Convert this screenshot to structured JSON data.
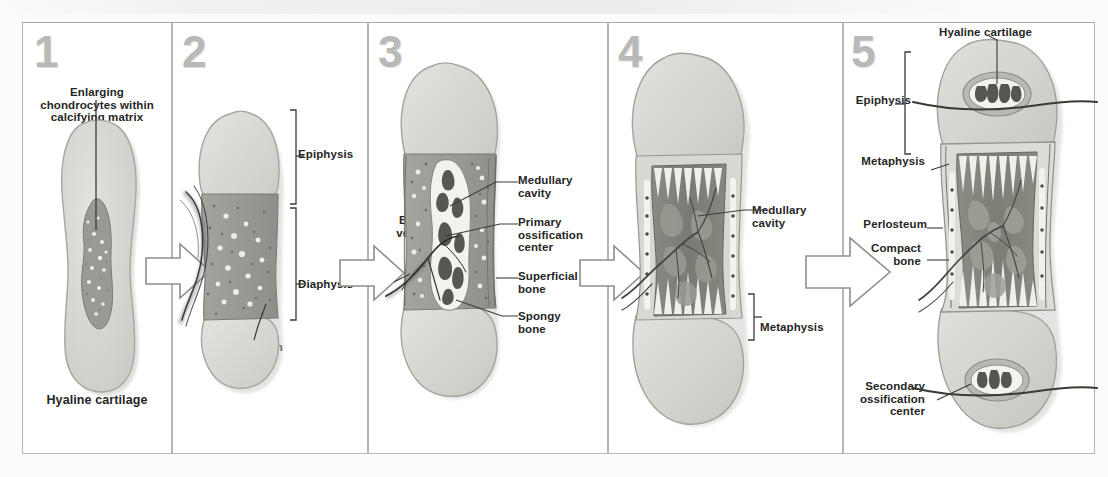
{
  "figure": {
    "panel_count": 5,
    "accent_gray": "#b9b9b7",
    "text_color": "#262626"
  },
  "panels": [
    {
      "number": "1",
      "labels": {
        "top": "Enlarging\nchondrocytes within\ncalcifying matrix",
        "top_line1": "Enlarging",
        "top_line2": "chondrocytes within",
        "top_line3": "calcifying matrix",
        "bottom": "Hyaline cartilage"
      }
    },
    {
      "number": "2",
      "labels": {
        "epiphysis": "Epiphysis",
        "diaphysis": "Diaphysis",
        "bone_formation_line1": "Bone",
        "bone_formation_line2": "formation"
      }
    },
    {
      "number": "3",
      "labels": {
        "blood_vessel_line1": "Blood",
        "blood_vessel_line2": "vessel",
        "medullary_line1": "Medullary",
        "medullary_line2": "cavity",
        "primary_line1": "Primary",
        "primary_line2": "ossification",
        "primary_line3": "center",
        "superficial_line1": "Superficial",
        "superficial_line2": "bone",
        "spongy_line1": "Spongy",
        "spongy_line2": "bone"
      }
    },
    {
      "number": "4",
      "labels": {
        "medullary_line1": "Medullary",
        "medullary_line2": "cavity",
        "metaphysis": "Metaphysis"
      }
    },
    {
      "number": "5",
      "labels": {
        "hyaline_cartilage": "Hyaline cartilage",
        "epiphysis": "Epiphysis",
        "metaphysis": "Metaphysis",
        "periosteum": "Perlosteum",
        "compact_line1": "Compact",
        "compact_line2": "bone",
        "secondary_line1": "Secondary",
        "secondary_line2": "ossification",
        "secondary_line3": "center"
      }
    }
  ],
  "arrows": [
    {
      "name": "arrow-1-to-2"
    },
    {
      "name": "arrow-2-to-3"
    },
    {
      "name": "arrow-3-to-4"
    },
    {
      "name": "arrow-4-to-5"
    }
  ]
}
